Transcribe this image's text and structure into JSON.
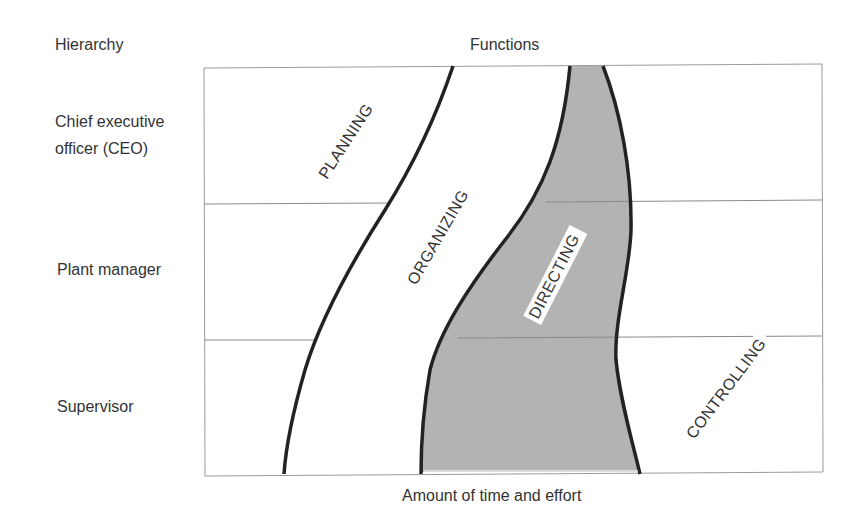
{
  "header": {
    "hierarchy_title": "Hierarchy",
    "functions_title": "Functions"
  },
  "hierarchy_levels": [
    {
      "line1": "Chief executive",
      "line2": "officer (CEO)"
    },
    {
      "line1": "Plant manager"
    },
    {
      "line1": "Supervisor"
    }
  ],
  "functions": {
    "planning": "PLANNING",
    "organizing": "ORGANIZING",
    "directing": "DIRECTING",
    "controlling": "CONTROLLING"
  },
  "footer": {
    "x_axis_label": "Amount of time and effort"
  },
  "colors": {
    "directing_fill": "#b3b3b3",
    "curve_stroke": "#222222",
    "frame_stroke": "#9a9a9a"
  }
}
